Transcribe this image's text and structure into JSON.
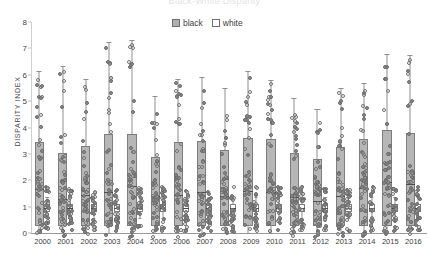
{
  "title": "Black-White Disparity",
  "legend": {
    "position": "top-center",
    "items": [
      {
        "label": "black",
        "swatch": "filled-square-icon",
        "color": "#b0b0b0"
      },
      {
        "label": "white",
        "swatch": "empty-square-icon",
        "color": "#ffffff"
      }
    ]
  },
  "axes": {
    "ylabel": "DISPARITY INDEX",
    "xlabel": "",
    "yticks": [
      "0",
      "1",
      "2",
      "3",
      "4",
      "5",
      "6",
      "7",
      "8"
    ],
    "ylim": [
      0,
      8
    ],
    "grid": false
  },
  "chart_data": {
    "type": "box",
    "title": "Black-White Disparity",
    "xlabel": "",
    "ylabel": "DISPARITY INDEX",
    "ylim": [
      0,
      8
    ],
    "grid": false,
    "legend_position": "top-center",
    "categories": [
      "2000",
      "2001",
      "2002",
      "2003",
      "2004",
      "2005",
      "2006",
      "2007",
      "2008",
      "2009",
      "2010",
      "2011",
      "2012",
      "2013",
      "2014",
      "2015",
      "2016"
    ],
    "series": [
      {
        "name": "black",
        "color": "#b6b6b6",
        "boxes": [
          {
            "category": "2000",
            "whisker_low": 0.0,
            "q1": 0.25,
            "median": 1.65,
            "q3": 3.45,
            "whisker_high": 6.15
          },
          {
            "category": "2001",
            "whisker_low": 0.0,
            "q1": 0.25,
            "median": 1.3,
            "q3": 3.05,
            "whisker_high": 6.35
          },
          {
            "category": "2002",
            "whisker_low": 0.0,
            "q1": 0.25,
            "median": 1.45,
            "q3": 3.3,
            "whisker_high": 5.85
          },
          {
            "category": "2003",
            "whisker_low": 0.0,
            "q1": 0.25,
            "median": 1.55,
            "q3": 3.75,
            "whisker_high": 7.25
          },
          {
            "category": "2004",
            "whisker_low": 0.0,
            "q1": 0.25,
            "median": 1.8,
            "q3": 3.75,
            "whisker_high": 7.3
          },
          {
            "category": "2005",
            "whisker_low": 0.0,
            "q1": 0.25,
            "median": 1.4,
            "q3": 2.9,
            "whisker_high": 5.2
          },
          {
            "category": "2006",
            "whisker_low": 0.0,
            "q1": 0.25,
            "median": 1.45,
            "q3": 3.45,
            "whisker_high": 5.85
          },
          {
            "category": "2007",
            "whisker_low": 0.0,
            "q1": 0.25,
            "median": 1.55,
            "q3": 3.5,
            "whisker_high": 5.9
          },
          {
            "category": "2008",
            "whisker_low": 0.0,
            "q1": 0.25,
            "median": 1.4,
            "q3": 3.15,
            "whisker_high": 5.5
          },
          {
            "category": "2009",
            "whisker_low": 0.0,
            "q1": 0.25,
            "median": 1.6,
            "q3": 3.6,
            "whisker_high": 6.15
          },
          {
            "category": "2010",
            "whisker_low": 0.0,
            "q1": 0.25,
            "median": 1.55,
            "q3": 3.55,
            "whisker_high": 5.8
          },
          {
            "category": "2011",
            "whisker_low": 0.0,
            "q1": 0.25,
            "median": 1.35,
            "q3": 3.05,
            "whisker_high": 5.1
          },
          {
            "category": "2012",
            "whisker_low": 0.0,
            "q1": 0.25,
            "median": 1.2,
            "q3": 2.8,
            "whisker_high": 4.7
          },
          {
            "category": "2013",
            "whisker_low": 0.0,
            "q1": 0.25,
            "median": 1.4,
            "q3": 3.25,
            "whisker_high": 5.5
          },
          {
            "category": "2014",
            "whisker_low": 0.0,
            "q1": 0.25,
            "median": 1.7,
            "q3": 3.55,
            "whisker_high": 5.7
          },
          {
            "category": "2015",
            "whisker_low": 0.0,
            "q1": 0.25,
            "median": 1.95,
            "q3": 3.9,
            "whisker_high": 6.8
          },
          {
            "category": "2016",
            "whisker_low": 0.0,
            "q1": 0.25,
            "median": 1.85,
            "q3": 3.8,
            "whisker_high": 6.75
          }
        ]
      },
      {
        "name": "white",
        "color": "#ffffff",
        "boxes": [
          {
            "category": "2000",
            "whisker_low": 0.55,
            "q1": 0.8,
            "median": 0.95,
            "q3": 1.1,
            "whisker_high": 1.35
          },
          {
            "category": "2001",
            "whisker_low": 0.55,
            "q1": 0.8,
            "median": 0.95,
            "q3": 1.1,
            "whisker_high": 1.35
          },
          {
            "category": "2002",
            "whisker_low": 0.55,
            "q1": 0.8,
            "median": 0.95,
            "q3": 1.1,
            "whisker_high": 1.35
          },
          {
            "category": "2003",
            "whisker_low": 0.55,
            "q1": 0.8,
            "median": 0.95,
            "q3": 1.1,
            "whisker_high": 1.35
          },
          {
            "category": "2004",
            "whisker_low": 0.55,
            "q1": 0.8,
            "median": 0.95,
            "q3": 1.1,
            "whisker_high": 1.35
          },
          {
            "category": "2005",
            "whisker_low": 0.55,
            "q1": 0.8,
            "median": 0.95,
            "q3": 1.1,
            "whisker_high": 1.35
          },
          {
            "category": "2006",
            "whisker_low": 0.55,
            "q1": 0.8,
            "median": 0.95,
            "q3": 1.1,
            "whisker_high": 1.35
          },
          {
            "category": "2007",
            "whisker_low": 0.55,
            "q1": 0.8,
            "median": 0.95,
            "q3": 1.1,
            "whisker_high": 1.35
          },
          {
            "category": "2008",
            "whisker_low": 0.55,
            "q1": 0.8,
            "median": 0.95,
            "q3": 1.1,
            "whisker_high": 1.35
          },
          {
            "category": "2009",
            "whisker_low": 0.55,
            "q1": 0.8,
            "median": 0.95,
            "q3": 1.1,
            "whisker_high": 1.35
          },
          {
            "category": "2010",
            "whisker_low": 0.55,
            "q1": 0.8,
            "median": 0.95,
            "q3": 1.1,
            "whisker_high": 1.35
          },
          {
            "category": "2011",
            "whisker_low": 0.55,
            "q1": 0.8,
            "median": 0.95,
            "q3": 1.1,
            "whisker_high": 1.35
          },
          {
            "category": "2012",
            "whisker_low": 0.55,
            "q1": 0.8,
            "median": 0.95,
            "q3": 1.1,
            "whisker_high": 1.35
          },
          {
            "category": "2013",
            "whisker_low": 0.55,
            "q1": 0.8,
            "median": 0.95,
            "q3": 1.1,
            "whisker_high": 1.35
          },
          {
            "category": "2014",
            "whisker_low": 0.55,
            "q1": 0.8,
            "median": 0.95,
            "q3": 1.1,
            "whisker_high": 1.35
          },
          {
            "category": "2015",
            "whisker_low": 0.55,
            "q1": 0.8,
            "median": 0.95,
            "q3": 1.1,
            "whisker_high": 1.35
          },
          {
            "category": "2016",
            "whisker_low": 0.55,
            "q1": 0.8,
            "median": 0.95,
            "q3": 1.1,
            "whisker_high": 1.35
          }
        ]
      }
    ]
  }
}
